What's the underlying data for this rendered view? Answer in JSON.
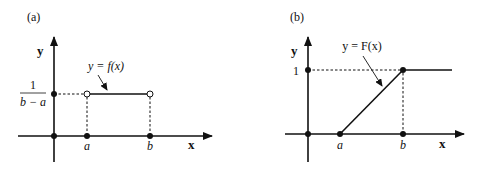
{
  "figure": {
    "panels": [
      {
        "id": "a",
        "label": "(a)",
        "y_axis_label": "y",
        "x_axis_label": "x",
        "tick_a": "a",
        "tick_b": "b",
        "y_level_numerator": "1",
        "y_level_denominator": "b − a",
        "curve_label": "y = f(x)",
        "description": "Uniform probability density: constant 1/(b−a) on (a,b), open circles at endpoints"
      },
      {
        "id": "b",
        "label": "(b)",
        "y_axis_label": "y",
        "x_axis_label": "x",
        "tick_a": "a",
        "tick_b": "b",
        "y_level": "1",
        "curve_label": "y = F(x)",
        "description": "Uniform cumulative distribution: 0 before a, linear rise to 1 at b, constant 1 after"
      }
    ],
    "colors": {
      "ink": "#111111",
      "background": "#ffffff"
    }
  }
}
